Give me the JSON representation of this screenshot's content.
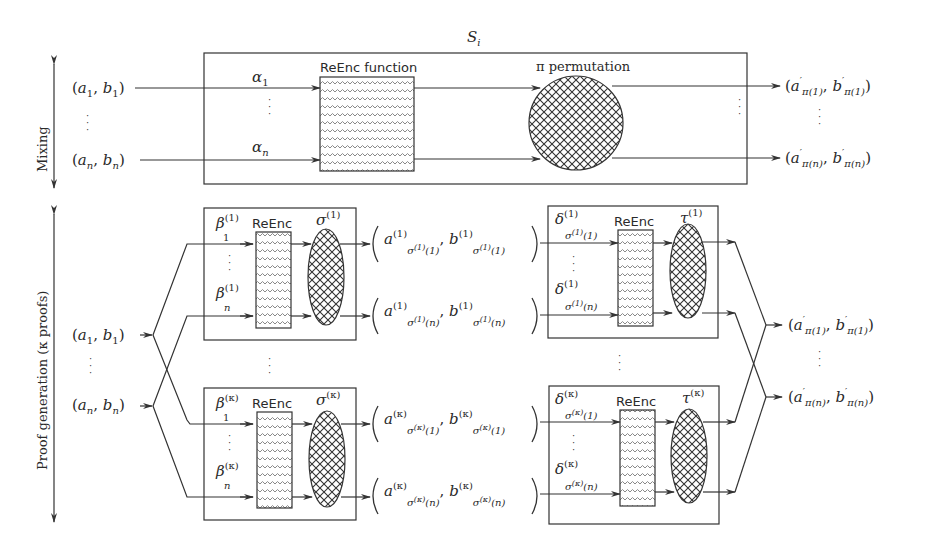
{
  "diagram": {
    "type": "mix-net re-encryption proof diagram",
    "top_section": {
      "side_label": "Mixing",
      "server_label": "S_i",
      "inputs": [
        "(a_1, b_1)",
        "(a_n, b_n)"
      ],
      "randomness": [
        "α_1",
        "α_n"
      ],
      "reenc_label": "ReEnc function",
      "perm_label": "π permutation",
      "outputs": [
        "(a'_π(1), b'_π(1))",
        "(a'_π(n), b'_π(n))"
      ]
    },
    "bottom_section": {
      "side_label": "Proof generation (κ proofs)",
      "inputs": [
        "(a_1, b_1)",
        "(a_n, b_n)"
      ],
      "proof_blocks_left": [
        {
          "beta_top": "β_1^(1)",
          "beta_bottom": "β_n^(1)",
          "reenc": "ReEnc",
          "perm": "σ^(1)"
        },
        {
          "beta_top": "β_1^(κ)",
          "beta_bottom": "β_n^(κ)",
          "reenc": "ReEnc",
          "perm": "σ^(κ)"
        }
      ],
      "intermediate_outputs": [
        "(a^(1)_σ(1)(1), b^(1)_σ(1)(1))",
        "(a^(1)_σ(1)(n), b^(1)_σ(1)(n))",
        "(a^(κ)_σ(κ)(1), b^(κ)_σ(κ)(1))",
        "(a^(κ)_σ(κ)(n), b^(κ)_σ(κ)(n))"
      ],
      "proof_blocks_right": [
        {
          "delta_top": "δ^(1)_σ(1)(1)",
          "delta_bottom": "δ^(1)_σ(1)(n)",
          "reenc": "ReEnc",
          "perm": "τ^(1)"
        },
        {
          "delta_top": "δ^(κ)_σ(κ)(1)",
          "delta_bottom": "δ^(κ)_σ(κ)(n)",
          "reenc": "ReEnc",
          "perm": "τ^(κ)"
        }
      ],
      "outputs": [
        "(a'_π(1), b'_π(1))",
        "(a'_π(n), b'_π(n))"
      ]
    },
    "text": {
      "mixing": "Mixing",
      "proofgen": "Proof generation (κ proofs)",
      "si": "S",
      "si_sub": "i",
      "reenc_function": "ReEnc function",
      "pi_permutation": "π permutation",
      "reenc": "ReEnc",
      "a": "a",
      "b": "b",
      "one": "1",
      "n": "n",
      "alpha": "α",
      "beta": "β",
      "delta": "δ",
      "sigma": "σ",
      "tau": "τ",
      "pi": "π",
      "sup1": "(1)",
      "supk": "(κ)",
      "prime": "′",
      "lp": "(",
      "rp": ")",
      "comma": ",",
      "pi1": "π(1)",
      "pin": "π(n)",
      "s1_1": "σ",
      "idx1": "(1)",
      "idxn": "(n)",
      "vdots": "·\n·\n·"
    },
    "colors": {
      "line": "#333333",
      "hatch": "#8a8a8a",
      "background": "#ffffff"
    }
  }
}
